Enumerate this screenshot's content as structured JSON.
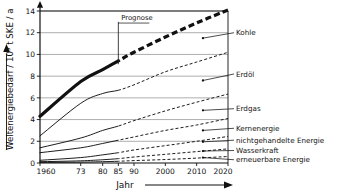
{
  "chart_data": {
    "type": "area",
    "title": "",
    "xlabel": "Jahr",
    "ylabel": "Weltenergiebedarf / 10⁹ t SKE / a",
    "ylabel_parts": {
      "main": "Weltenergiebedarf / 10",
      "exp": "9",
      "tail": " t SKE / a"
    },
    "xlim": [
      1960,
      2020
    ],
    "ylim": [
      0,
      14
    ],
    "grid": true,
    "legend_position": "right-inline-labels",
    "xticks": [
      1960,
      1973,
      1980,
      1985,
      1990,
      2000,
      2010,
      2020
    ],
    "xtick_labels": [
      "1960",
      "73",
      "80",
      "85",
      "90",
      "2000",
      "2010",
      "2020"
    ],
    "yticks": [
      0,
      2,
      4,
      6,
      8,
      10,
      12,
      14
    ],
    "ytick_labels": [
      "0",
      "2",
      "4",
      "6",
      "8",
      "10",
      "12",
      "14"
    ],
    "forecast_start": 1985,
    "annotation": {
      "text": "Prognose",
      "x": 1985,
      "y": 13.0
    },
    "x": [
      1960,
      1973,
      1980,
      1985,
      1990,
      2000,
      2010,
      2020
    ],
    "series": [
      {
        "name": "Kohle",
        "label": "Kohle",
        "style": "thick",
        "values": [
          4.3,
          7.5,
          8.6,
          9.4,
          10.2,
          11.6,
          12.9,
          14.1
        ],
        "label_y": 12.0,
        "marker_x": 2012,
        "marker_y": 11.5
      },
      {
        "name": "Erdoel",
        "label": "Erdöl",
        "style": "thin",
        "values": [
          2.5,
          5.5,
          6.4,
          6.7,
          7.2,
          8.4,
          9.3,
          10.2
        ],
        "label_y": 8.2,
        "marker_x": 2012,
        "marker_y": 7.6
      },
      {
        "name": "Erdgas",
        "label": "Erdgas",
        "style": "thin",
        "values": [
          1.4,
          2.3,
          3.0,
          3.4,
          3.9,
          4.8,
          5.6,
          6.35
        ],
        "label_y": 5.0,
        "marker_x": 2012,
        "marker_y": 4.85
      },
      {
        "name": "Kernenergie",
        "label": "Kernenergie",
        "style": "thin",
        "values": [
          0.95,
          1.4,
          1.8,
          2.1,
          2.4,
          3.0,
          3.5,
          4.1
        ],
        "label_y": 3.2,
        "marker_x": 2012,
        "marker_y": 3.0
      },
      {
        "name": "nichtgehandelte Energie",
        "label": "nichtgehandelte Energie",
        "style": "thin",
        "values": [
          0.25,
          0.5,
          0.75,
          0.95,
          1.2,
          1.6,
          2.0,
          2.45
        ],
        "label_y": 2.1,
        "marker_x": 2012,
        "marker_y": 1.95
      },
      {
        "name": "Wasserkraft",
        "label": "Wasserkraft",
        "style": "thin",
        "values": [
          0.12,
          0.2,
          0.3,
          0.4,
          0.55,
          0.8,
          1.05,
          1.3
        ],
        "label_y": 1.15,
        "marker_x": 2012,
        "marker_y": 1.1
      },
      {
        "name": "erneuerbare Energie",
        "label": "erneuerbare Energie",
        "style": "thin",
        "values": [
          0.05,
          0.08,
          0.12,
          0.16,
          0.22,
          0.32,
          0.45,
          0.6
        ],
        "label_y": 0.3,
        "marker_x": 2012,
        "marker_y": 0.5
      }
    ]
  },
  "colors": {
    "ink": "#111111",
    "grid": "#8a8a8a",
    "background": "#ffffff"
  }
}
